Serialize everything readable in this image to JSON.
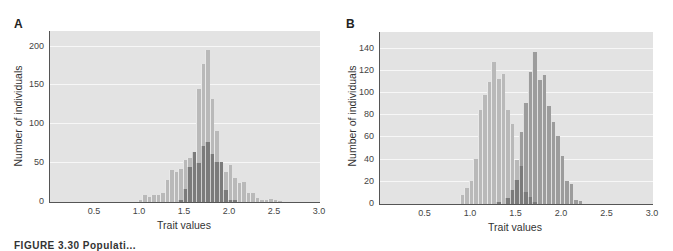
{
  "figure": {
    "caption": "FIGURE 3.30 Populati..."
  },
  "chart_data": [
    {
      "panel": "A",
      "type": "bar",
      "title": "",
      "xlabel": "Trait values",
      "ylabel": "Number of individuals",
      "xlim": [
        0,
        3.0
      ],
      "ylim": [
        0,
        220
      ],
      "xticks": [
        "0.5",
        "1.0",
        "1.5",
        "2.0",
        "2.5",
        "3.0"
      ],
      "yticks": [
        "0",
        "50",
        "100",
        "150",
        "200"
      ],
      "grid": true,
      "bin_width": 0.05,
      "series": [
        {
          "name": "total (light)",
          "x": [
            1.0,
            1.05,
            1.1,
            1.15,
            1.2,
            1.25,
            1.3,
            1.35,
            1.4,
            1.45,
            1.5,
            1.55,
            1.6,
            1.65,
            1.7,
            1.75,
            1.8,
            1.85,
            1.9,
            1.95,
            2.0,
            2.05,
            2.1,
            2.15,
            2.2,
            2.25,
            2.3,
            2.35,
            2.4,
            2.45,
            2.5,
            2.55
          ],
          "values": [
            2,
            9,
            7,
            9,
            9,
            11,
            28,
            41,
            38,
            42,
            54,
            56,
            60,
            145,
            178,
            196,
            132,
            92,
            52,
            39,
            48,
            31,
            24,
            26,
            12,
            11,
            5,
            3,
            2,
            4,
            2,
            1
          ]
        },
        {
          "name": "subset (dark)",
          "x": [
            1.45,
            1.5,
            1.55,
            1.6,
            1.65,
            1.7,
            1.75,
            1.8,
            1.85,
            1.9,
            1.95,
            2.0,
            2.05
          ],
          "values": [
            2,
            17,
            45,
            64,
            50,
            72,
            77,
            62,
            52,
            52,
            16,
            3,
            3
          ]
        }
      ]
    },
    {
      "panel": "B",
      "type": "bar",
      "title": "",
      "xlabel": "Trait values",
      "ylabel": "Number of individuals",
      "xlim": [
        0,
        3.0
      ],
      "ylim": [
        0,
        155
      ],
      "xticks": [
        "0.5",
        "1.0",
        "1.5",
        "2.0",
        "2.5",
        "3.0"
      ],
      "yticks": [
        "0",
        "20",
        "40",
        "60",
        "80",
        "100",
        "120",
        "140"
      ],
      "grid": true,
      "bin_width": 0.05,
      "series": [
        {
          "name": "population 1 (light)",
          "x": [
            0.9,
            0.95,
            1.0,
            1.05,
            1.1,
            1.15,
            1.2,
            1.25,
            1.3,
            1.35,
            1.4,
            1.45,
            1.5,
            1.55
          ],
          "values": [
            8,
            14,
            21,
            41,
            85,
            98,
            110,
            128,
            113,
            117,
            85,
            72,
            40,
            36
          ]
        },
        {
          "name": "population 2 (mid)",
          "x": [
            1.55,
            1.6,
            1.65,
            1.7,
            1.75,
            1.8,
            1.85,
            1.9,
            1.95,
            2.0,
            2.05,
            2.1,
            2.15,
            2.2
          ],
          "values": [
            65,
            91,
            119,
            137,
            112,
            116,
            88,
            74,
            61,
            43,
            21,
            18,
            4,
            3
          ]
        },
        {
          "name": "overlap (dark)",
          "x": [
            1.3,
            1.4,
            1.45,
            1.5,
            1.55,
            1.6,
            1.65,
            1.7
          ],
          "values": [
            2,
            5,
            13,
            22,
            34,
            11,
            6,
            2
          ]
        }
      ]
    }
  ]
}
